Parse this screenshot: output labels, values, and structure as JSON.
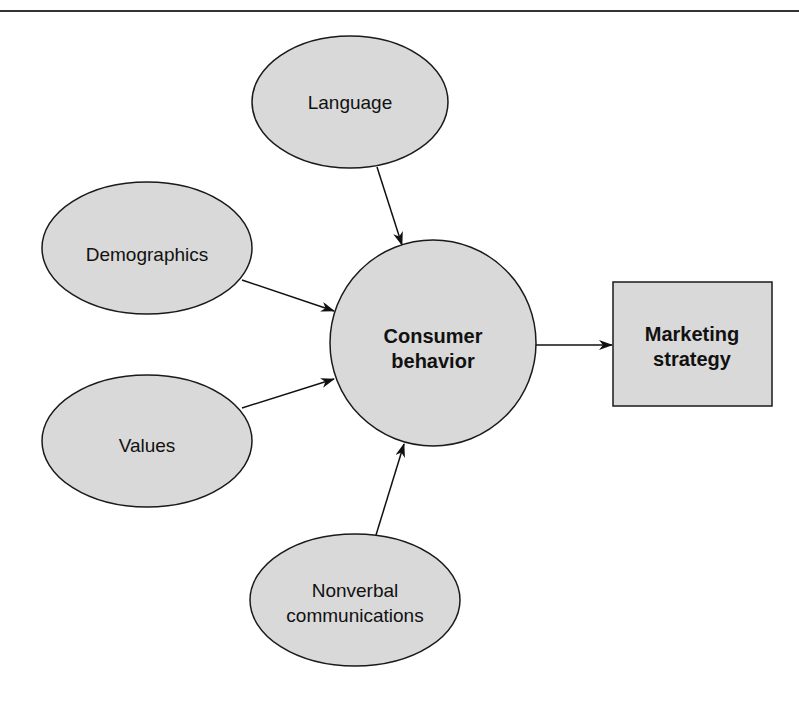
{
  "diagram": {
    "type": "influence-flow",
    "colors": {
      "fill": "#d9d9d9",
      "stroke": "#1a1a1a",
      "rule": "#333333",
      "background": "#ffffff"
    },
    "nodes": [
      {
        "id": "language",
        "shape": "ellipse",
        "lines": [
          "Language"
        ]
      },
      {
        "id": "demographics",
        "shape": "ellipse",
        "lines": [
          "Demographics"
        ]
      },
      {
        "id": "values",
        "shape": "ellipse",
        "lines": [
          "Values"
        ]
      },
      {
        "id": "nonverbal",
        "shape": "ellipse",
        "lines": [
          "Nonverbal",
          "communications"
        ]
      },
      {
        "id": "consumer",
        "shape": "circle",
        "lines": [
          "Consumer",
          "behavior"
        ]
      },
      {
        "id": "marketing",
        "shape": "rectangle",
        "lines": [
          "Marketing",
          "strategy"
        ]
      }
    ],
    "edges": [
      {
        "from": "language",
        "to": "consumer"
      },
      {
        "from": "demographics",
        "to": "consumer"
      },
      {
        "from": "values",
        "to": "consumer"
      },
      {
        "from": "nonverbal",
        "to": "consumer"
      },
      {
        "from": "consumer",
        "to": "marketing"
      }
    ]
  }
}
